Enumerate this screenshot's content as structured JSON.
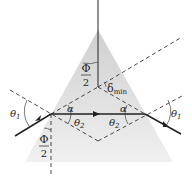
{
  "diagram": {
    "type": "prism-minimum-deviation",
    "colors": {
      "prism_fill_top": "#d6d6d6",
      "prism_fill_bottom": "#efefef",
      "line": "#222222",
      "dashed": "#333333"
    },
    "labels": {
      "half_apex_top_num": "Φ",
      "half_apex_top_den": "2",
      "delta_min": "δ",
      "delta_min_sub": "min",
      "alpha_left": "α",
      "alpha_right": "α",
      "theta2_left": "θ",
      "theta2_left_sub": "2",
      "theta2_right": "θ",
      "theta2_right_sub": "2",
      "theta1_left": "θ",
      "theta1_left_sub": "1",
      "theta1_right": "θ",
      "theta1_right_sub": "1",
      "half_apex_bottom_num": "Φ",
      "half_apex_bottom_den": "2"
    }
  }
}
